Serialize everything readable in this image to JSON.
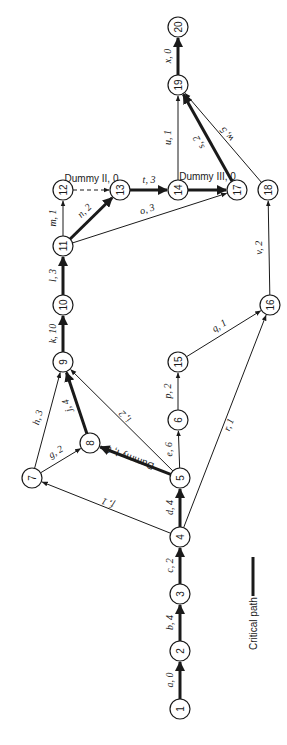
{
  "legend": {
    "label": "Critical path"
  },
  "colors": {
    "line": "#1a1a1a",
    "background": "#ffffff"
  },
  "nodes": [
    {
      "id": "1",
      "x": 180,
      "y": 709
    },
    {
      "id": "2",
      "x": 180,
      "y": 651
    },
    {
      "id": "3",
      "x": 180,
      "y": 594
    },
    {
      "id": "4",
      "x": 180,
      "y": 537
    },
    {
      "id": "5",
      "x": 180,
      "y": 478
    },
    {
      "id": "6",
      "x": 178,
      "y": 420
    },
    {
      "id": "7",
      "x": 32,
      "y": 478
    },
    {
      "id": "8",
      "x": 90,
      "y": 443
    },
    {
      "id": "9",
      "x": 63,
      "y": 362
    },
    {
      "id": "10",
      "x": 63,
      "y": 305
    },
    {
      "id": "11",
      "x": 63,
      "y": 246
    },
    {
      "id": "12",
      "x": 63,
      "y": 190
    },
    {
      "id": "13",
      "x": 120,
      "y": 190
    },
    {
      "id": "14",
      "x": 178,
      "y": 190
    },
    {
      "id": "15",
      "x": 178,
      "y": 362
    },
    {
      "id": "16",
      "x": 270,
      "y": 305
    },
    {
      "id": "17",
      "x": 237,
      "y": 190
    },
    {
      "id": "18",
      "x": 268,
      "y": 190
    },
    {
      "id": "19",
      "x": 178,
      "y": 85
    },
    {
      "id": "20",
      "x": 178,
      "y": 27
    }
  ],
  "edges": [
    {
      "from": "1",
      "to": "2",
      "label": "a, 0",
      "critical": true,
      "dummy": false
    },
    {
      "from": "2",
      "to": "3",
      "label": "b, 4",
      "critical": true,
      "dummy": false
    },
    {
      "from": "3",
      "to": "4",
      "label": "c, 2",
      "critical": true,
      "dummy": false
    },
    {
      "from": "4",
      "to": "5",
      "label": "d, 4",
      "critical": true,
      "dummy": false
    },
    {
      "from": "5",
      "to": "6",
      "label": "e, 6",
      "critical": false,
      "dummy": false
    },
    {
      "from": "4",
      "to": "7",
      "label": "f, 1",
      "critical": false,
      "dummy": false
    },
    {
      "from": "7",
      "to": "8",
      "label": "g, 2",
      "critical": false,
      "dummy": false
    },
    {
      "from": "7",
      "to": "9",
      "label": "h, 3",
      "critical": false,
      "dummy": false
    },
    {
      "from": "5",
      "to": "9",
      "label": "i, 2",
      "critical": false,
      "dummy": false
    },
    {
      "from": "8",
      "to": "9",
      "label": "j, 4",
      "critical": true,
      "dummy": false
    },
    {
      "from": "5",
      "to": "8",
      "label": "Dummy I, 0",
      "critical": true,
      "dummy": true
    },
    {
      "from": "9",
      "to": "10",
      "label": "k, 10",
      "critical": true,
      "dummy": false
    },
    {
      "from": "10",
      "to": "11",
      "label": "l, 3",
      "critical": true,
      "dummy": false
    },
    {
      "from": "11",
      "to": "12",
      "label": "m, 1",
      "critical": false,
      "dummy": false
    },
    {
      "from": "11",
      "to": "13",
      "label": "n, 2",
      "critical": true,
      "dummy": false
    },
    {
      "from": "11",
      "to": "17",
      "label": "o, 3",
      "critical": false,
      "dummy": false
    },
    {
      "from": "6",
      "to": "15",
      "label": "p, 2",
      "critical": false,
      "dummy": false
    },
    {
      "from": "15",
      "to": "16",
      "label": "q, 1",
      "critical": false,
      "dummy": false
    },
    {
      "from": "4",
      "to": "16",
      "label": "r, 1",
      "critical": false,
      "dummy": false
    },
    {
      "from": "17",
      "to": "19",
      "label": "s, 2",
      "critical": true,
      "dummy": false
    },
    {
      "from": "13",
      "to": "14",
      "label": "t, 3",
      "critical": true,
      "dummy": false
    },
    {
      "from": "14",
      "to": "19",
      "label": "u, 1",
      "critical": false,
      "dummy": false
    },
    {
      "from": "16",
      "to": "18",
      "label": "v, 2",
      "critical": false,
      "dummy": false
    },
    {
      "from": "18",
      "to": "19",
      "label": "w, 5",
      "critical": false,
      "dummy": false
    },
    {
      "from": "19",
      "to": "20",
      "label": "x, 0",
      "critical": true,
      "dummy": false
    },
    {
      "from": "12",
      "to": "13",
      "label": "Dummy II, 0",
      "critical": false,
      "dummy": true
    },
    {
      "from": "14",
      "to": "17",
      "label": "Dummy III, 0",
      "critical": true,
      "dummy": true
    }
  ]
}
